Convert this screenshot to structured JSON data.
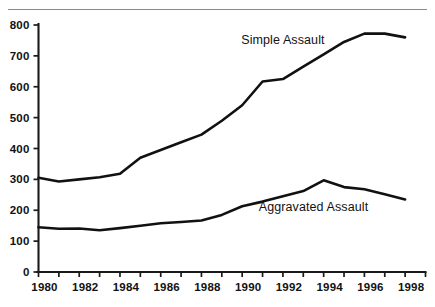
{
  "figure": {
    "has_top_rule": true,
    "background": "#ffffff",
    "line_color": "#111111",
    "text_color": "#121212"
  },
  "chart_data": {
    "type": "line",
    "title": "",
    "subtitle": "",
    "xlabel": "",
    "ylabel": "",
    "grid": false,
    "legend_position": "inline-annotation",
    "xlim": [
      1980,
      1999
    ],
    "ylim": [
      0,
      800
    ],
    "yticks": [
      0,
      100,
      200,
      300,
      400,
      500,
      600,
      700,
      800
    ],
    "ytick_labels": [
      "0",
      "100",
      "200",
      "300",
      "400",
      "500",
      "600",
      "700",
      "800"
    ],
    "xticks": [
      1980,
      1981,
      1982,
      1983,
      1984,
      1985,
      1986,
      1987,
      1988,
      1989,
      1990,
      1991,
      1992,
      1993,
      1994,
      1995,
      1996,
      1997,
      1998
    ],
    "xtick_labels": [
      "1980",
      "",
      "1982",
      "",
      "1984",
      "",
      "1986",
      "",
      "1988",
      "",
      "1990",
      "",
      "1992",
      "",
      "1994",
      "",
      "1996",
      "",
      "1998"
    ],
    "x": [
      1980,
      1981,
      1982,
      1983,
      1984,
      1985,
      1986,
      1987,
      1988,
      1989,
      1990,
      1991,
      1992,
      1993,
      1994,
      1995,
      1996,
      1997,
      1998
    ],
    "series": [
      {
        "name": "Simple Assault",
        "label_x": 1992.0,
        "label_y": 740,
        "values": [
          305,
          293,
          300,
          307,
          318,
          370,
          395,
          420,
          445,
          490,
          540,
          617,
          625,
          665,
          705,
          745,
          772,
          772,
          760
        ]
      },
      {
        "name": "Aggravated Assault",
        "label_x": 1993.5,
        "label_y": 196,
        "values": [
          145,
          140,
          141,
          135,
          142,
          150,
          158,
          162,
          167,
          185,
          213,
          228,
          245,
          262,
          297,
          275,
          268,
          252,
          235
        ]
      }
    ],
    "annotations": [
      {
        "text": "Simple Assault",
        "x": 1992.0,
        "y": 740
      },
      {
        "text": "Aggravated Assault",
        "x": 1993.5,
        "y": 196
      }
    ]
  }
}
